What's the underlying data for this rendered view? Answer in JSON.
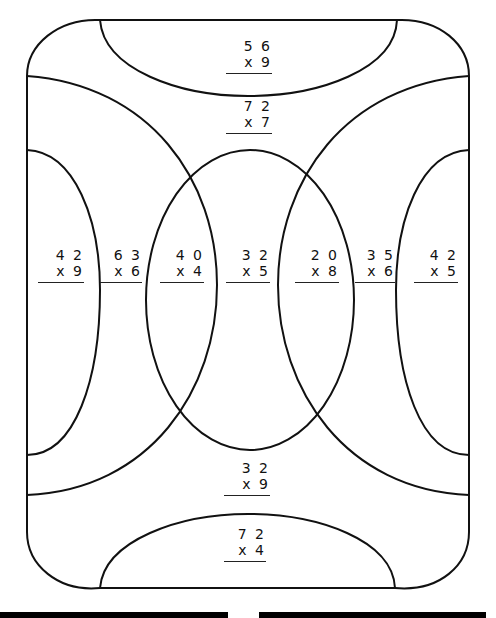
{
  "worksheet": {
    "regions": [
      {
        "id": "top-cap",
        "top": "5 6",
        "bottom": "x 9"
      },
      {
        "id": "upper-band",
        "top": "7 2",
        "bottom": "x 7"
      },
      {
        "id": "left-outer",
        "top": "4 2",
        "bottom": "x 9"
      },
      {
        "id": "left-band",
        "top": "6 3",
        "bottom": "x 6"
      },
      {
        "id": "left-lens",
        "top": "4 0",
        "bottom": "x 4"
      },
      {
        "id": "center",
        "top": "3 2",
        "bottom": "x 5"
      },
      {
        "id": "right-lens",
        "top": "2 0",
        "bottom": "x 8"
      },
      {
        "id": "right-band",
        "top": "3 5",
        "bottom": "x 6"
      },
      {
        "id": "right-outer",
        "top": "4 2",
        "bottom": "x 5"
      },
      {
        "id": "lower-band",
        "top": "3 2",
        "bottom": "x 9"
      },
      {
        "id": "bottom-cap",
        "top": "7 2",
        "bottom": "x 4"
      }
    ]
  },
  "colors": {
    "stroke": "#111111",
    "background": "#ffffff"
  }
}
